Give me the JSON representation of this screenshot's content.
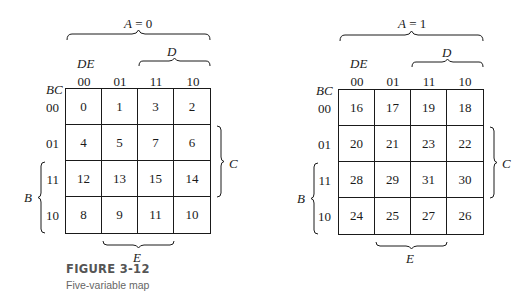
{
  "figure": {
    "number": "FIGURE 3-12",
    "caption": "Five-variable map"
  },
  "maps": [
    {
      "title_var": "A",
      "title_eq": " = 0",
      "col_var": "DE",
      "row_var": "BC",
      "col_headers": [
        "00",
        "01",
        "11",
        "10"
      ],
      "row_headers": [
        "00",
        "01",
        "11",
        "10"
      ],
      "cells": [
        [
          "0",
          "1",
          "3",
          "2"
        ],
        [
          "4",
          "5",
          "7",
          "6"
        ],
        [
          "12",
          "13",
          "15",
          "14"
        ],
        [
          "8",
          "9",
          "11",
          "10"
        ]
      ],
      "brace_top": "D",
      "brace_right": "C",
      "brace_left": "B",
      "brace_bottom": "E"
    },
    {
      "title_var": "A",
      "title_eq": " = 1",
      "col_var": "DE",
      "row_var": "BC",
      "col_headers": [
        "00",
        "01",
        "11",
        "10"
      ],
      "row_headers": [
        "00",
        "01",
        "11",
        "10"
      ],
      "cells": [
        [
          "16",
          "17",
          "19",
          "18"
        ],
        [
          "20",
          "21",
          "23",
          "22"
        ],
        [
          "28",
          "29",
          "31",
          "30"
        ],
        [
          "24",
          "25",
          "27",
          "26"
        ]
      ],
      "brace_top": "D",
      "brace_right": "C",
      "brace_left": "B",
      "brace_bottom": "E"
    }
  ]
}
